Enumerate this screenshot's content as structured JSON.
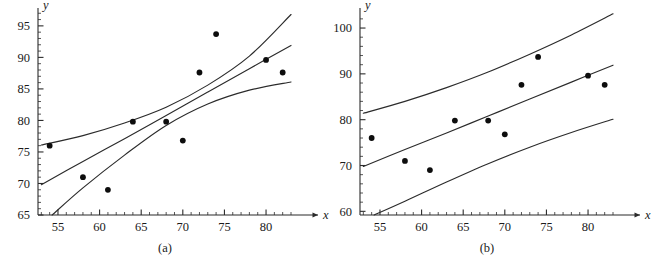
{
  "figure": {
    "caption_a": "(a)",
    "caption_b": "(b)",
    "background_color": "#ffffff",
    "ink_color": "#2b2b2b",
    "point_color": "#0d0d0d"
  },
  "chart_data": [
    {
      "type": "scatter",
      "panel": "a",
      "title": "",
      "subtitle": "",
      "caption": "(a)",
      "description": "Scatter plot with fitted least-squares regression line and confidence-interval bands that are narrowest near the mean of x and flare outward at both extremes.",
      "xlabel": "x",
      "ylabel": "y",
      "xlim": [
        52.6,
        83.6
      ],
      "ylim": [
        65,
        97.2
      ],
      "xticks": [
        55,
        60,
        65,
        70,
        75,
        80
      ],
      "xticklabels": [
        "55",
        "60",
        "65",
        "70",
        "75",
        "80"
      ],
      "yticks": [
        65,
        70,
        75,
        80,
        85,
        90,
        95
      ],
      "yticklabels": [
        "65",
        "70",
        "75",
        "80",
        "85",
        "90",
        "95"
      ],
      "x_minor_tick_step": 1,
      "y_minor_tick_step": 1,
      "grid": false,
      "legend": false,
      "legend_position": "none",
      "x": [
        54,
        58,
        61,
        64,
        68,
        70,
        72,
        74,
        80,
        82
      ],
      "y": [
        76.0,
        71.0,
        69.0,
        79.8,
        79.8,
        76.8,
        87.6,
        93.7,
        89.6,
        87.6
      ],
      "series": [
        {
          "name": "observations",
          "type": "scatter",
          "x": [
            54,
            58,
            61,
            64,
            68,
            70,
            72,
            74,
            80,
            82
          ],
          "values": [
            76.0,
            71.0,
            69.0,
            79.8,
            79.8,
            76.8,
            87.6,
            93.7,
            89.6,
            87.6
          ]
        },
        {
          "name": "fitted regression line",
          "type": "line",
          "x": [
            53,
            58,
            63,
            68,
            73,
            78,
            83
          ],
          "values": [
            69.8,
            73.5,
            77.1,
            80.8,
            84.5,
            88.2,
            91.9
          ]
        },
        {
          "name": "confidence band upper",
          "type": "line",
          "x": [
            53,
            58,
            63,
            68,
            73,
            78,
            83
          ],
          "values": [
            76.1,
            77.6,
            79.6,
            82.1,
            85.6,
            90.2,
            96.8
          ]
        },
        {
          "name": "confidence band lower",
          "type": "line",
          "x": [
            54.3,
            58,
            63,
            68,
            73,
            78,
            83
          ],
          "values": [
            65.0,
            69.3,
            74.5,
            79.2,
            82.6,
            84.8,
            86.1
          ]
        }
      ],
      "annotations": []
    },
    {
      "type": "scatter",
      "panel": "b",
      "title": "",
      "subtitle": "",
      "caption": "(b)",
      "description": "Same scatter and fitted regression line with prediction-interval bands, which are markedly wider than the confidence bands and nearly parallel to the fitted line.",
      "xlabel": "x",
      "ylabel": "y",
      "xlim": [
        52.6,
        83.6
      ],
      "ylim": [
        59.2,
        103.5
      ],
      "xticks": [
        55,
        60,
        65,
        70,
        75,
        80
      ],
      "xticklabels": [
        "55",
        "60",
        "65",
        "70",
        "75",
        "80"
      ],
      "yticks": [
        60,
        70,
        80,
        90,
        100
      ],
      "yticklabels": [
        "60",
        "70",
        "80",
        "90",
        "100"
      ],
      "x_minor_tick_step": 1,
      "y_minor_tick_step": 2,
      "grid": false,
      "legend": false,
      "legend_position": "none",
      "x": [
        54,
        58,
        61,
        64,
        68,
        70,
        72,
        74,
        80,
        82
      ],
      "y": [
        76.0,
        71.0,
        69.0,
        79.8,
        79.8,
        76.8,
        87.6,
        93.7,
        89.6,
        87.6
      ],
      "series": [
        {
          "name": "observations",
          "type": "scatter",
          "x": [
            54,
            58,
            61,
            64,
            68,
            70,
            72,
            74,
            80,
            82
          ],
          "values": [
            76.0,
            71.0,
            69.0,
            79.8,
            79.8,
            76.8,
            87.6,
            93.7,
            89.6,
            87.6
          ]
        },
        {
          "name": "fitted regression line",
          "type": "line",
          "x": [
            53,
            58,
            63,
            68,
            73,
            78,
            83
          ],
          "values": [
            69.8,
            73.5,
            77.1,
            80.8,
            84.5,
            88.2,
            91.9
          ]
        },
        {
          "name": "prediction band upper",
          "type": "line",
          "x": [
            53,
            58,
            63,
            68,
            73,
            78,
            83
          ],
          "values": [
            81.4,
            84.0,
            87.0,
            90.4,
            94.3,
            98.5,
            103.1
          ]
        },
        {
          "name": "prediction band lower",
          "type": "line",
          "x": [
            54.3,
            58,
            63,
            68,
            73,
            78,
            83
          ],
          "values": [
            59.2,
            62.2,
            66.4,
            70.4,
            74.0,
            77.2,
            80.1
          ]
        }
      ],
      "annotations": []
    }
  ]
}
